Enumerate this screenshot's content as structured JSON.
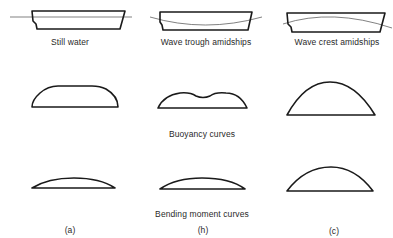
{
  "diagram": {
    "columns": [
      {
        "id": "a",
        "case_label": "Still water",
        "sub_label": "(a)",
        "waterline": "level"
      },
      {
        "id": "b",
        "case_label": "Wave trough amidships",
        "sub_label": "(h)",
        "waterline": "trough amidships"
      },
      {
        "id": "c",
        "case_label": "Wave crest amidships",
        "sub_label": "(c)",
        "waterline": "crest amidships"
      }
    ],
    "rows": {
      "buoyancy_label": "Buoyancy curves",
      "bending_label": "Bending moment curves"
    },
    "colors": {
      "line": "#1a1a1a",
      "waterline": "#4a4a4a",
      "background": "#ffffff",
      "text": "#2a2a2a"
    }
  }
}
